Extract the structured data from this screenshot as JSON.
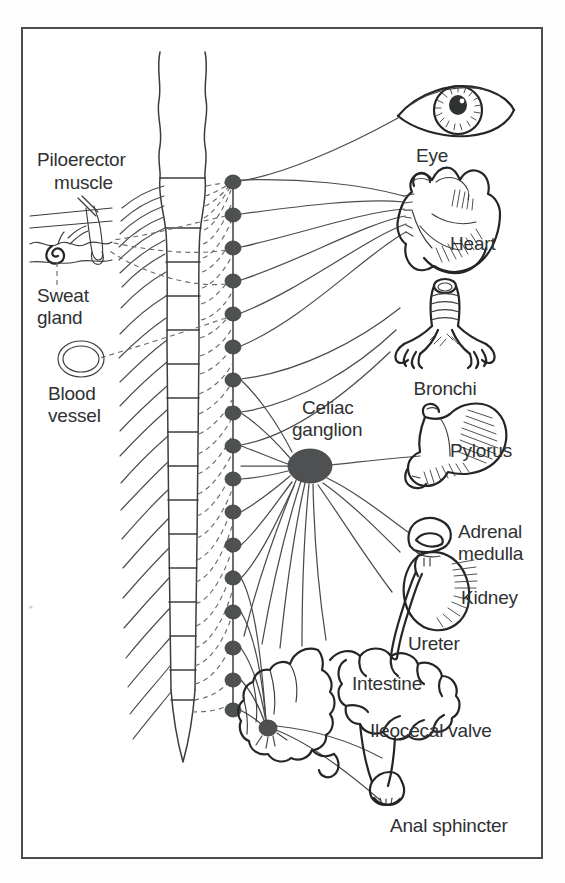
{
  "figure": {
    "background_color": "#fdfdfd",
    "frame_color": "#4a4c4e",
    "ink_color": "#2f3133",
    "ganglion_color": "#4e5052"
  },
  "left_labels": {
    "piloerector_muscle": "Piloerector\nmuscle",
    "piloerector_line1": "Piloerector",
    "piloerector_line2": "muscle",
    "sweat_gland_line1": "Sweat",
    "sweat_gland_line2": "gland",
    "blood_vessel_line1": "Blood",
    "blood_vessel_line2": "vessel"
  },
  "center_labels": {
    "celiac_line1": "Celiac",
    "celiac_line2": "ganglion"
  },
  "right_labels": {
    "eye": "Eye",
    "heart": "Heart",
    "bronchi": "Bronchi",
    "pylorus": "Pylorus",
    "adrenal_line1": "Adrenal",
    "adrenal_line2": "medulla",
    "kidney": "Kidney",
    "ureter": "Ureter",
    "intestine": "Intestine",
    "ileocecal_valve": "Ileocecal valve",
    "anal_sphincter": "Anal sphincter"
  },
  "structures": [
    {
      "name": "spinal-cord",
      "kind": "outline"
    },
    {
      "name": "sympathetic-chain",
      "kind": "ganglion-chain",
      "ganglion_count": 17
    },
    {
      "name": "celiac-ganglion",
      "kind": "ganglion",
      "cx": 310,
      "cy": 466,
      "rx": 22,
      "ry": 17
    },
    {
      "name": "hypogastric-ganglion",
      "kind": "ganglion",
      "cx": 268,
      "cy": 728,
      "rx": 9,
      "ry": 8
    },
    {
      "name": "eye",
      "kind": "organ"
    },
    {
      "name": "heart",
      "kind": "organ"
    },
    {
      "name": "bronchi",
      "kind": "organ"
    },
    {
      "name": "stomach-pylorus",
      "kind": "organ"
    },
    {
      "name": "adrenal-medulla",
      "kind": "organ"
    },
    {
      "name": "kidney",
      "kind": "organ"
    },
    {
      "name": "ureter",
      "kind": "organ"
    },
    {
      "name": "intestine",
      "kind": "organ"
    },
    {
      "name": "anal-sphincter",
      "kind": "organ"
    },
    {
      "name": "skin-piloerector-inset",
      "kind": "inset"
    },
    {
      "name": "sweat-gland-inset",
      "kind": "inset"
    },
    {
      "name": "blood-vessel-inset",
      "kind": "inset"
    }
  ]
}
